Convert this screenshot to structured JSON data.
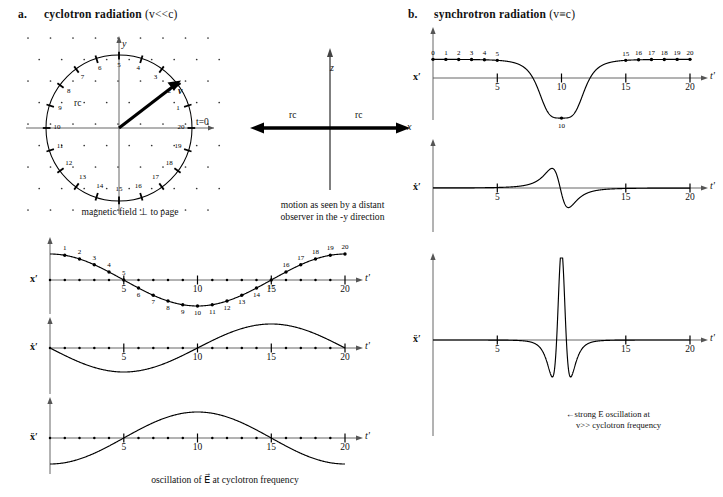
{
  "panels": {
    "a": {
      "letter": "a.",
      "title_bold": "cyclotron radiation",
      "title_paren": "(v<<c)",
      "circle_caption": "magnetic field ⊥ to page",
      "axis_y_label": "y",
      "radius_label": "rс",
      "velocity_label": "v",
      "t0_label": "t=0",
      "point_numbers": [
        "1",
        "2",
        "3",
        "4",
        "5",
        "6",
        "7",
        "8",
        "9",
        "10",
        "11",
        "12",
        "13",
        "14",
        "15",
        "16",
        "17",
        "18",
        "19",
        "20"
      ],
      "bottom_caption": "oscillation of E⃗ at cyclotron frequency"
    },
    "center": {
      "axis_z_label": "z",
      "axis_x_label": "x",
      "rc_left_label": "rс",
      "rc_right_label": "rс",
      "caption_line1": "motion as seen by a distant",
      "caption_line2": "observer in the -y direction"
    },
    "b": {
      "letter": "b.",
      "title_bold": "synchrotron radiation",
      "title_paren": "(v≡c)",
      "annotation_line1": "←strong E oscillation at",
      "annotation_line2": "v>> cyclotron frequency"
    }
  },
  "chart_data": [
    {
      "id": "a-plot-1",
      "type": "line",
      "title": "cyclotron x' vs t'",
      "ylabel": "x'",
      "xlabel": "t'",
      "xlim": [
        0,
        21
      ],
      "ylim": [
        -1.35,
        1.35
      ],
      "xticks": [
        5,
        10,
        15,
        20
      ],
      "xticklabels": [
        "5",
        "10",
        "15",
        "20"
      ],
      "grid": false,
      "marker_labels": [
        "1",
        "2",
        "3",
        "4",
        "5",
        "6",
        "7",
        "8",
        "9",
        "10",
        "11",
        "12",
        "13",
        "14",
        "15",
        "16",
        "17",
        "18",
        "19",
        "20"
      ],
      "x": [
        0,
        1,
        2,
        3,
        4,
        5,
        6,
        7,
        8,
        9,
        10,
        11,
        12,
        13,
        14,
        15,
        16,
        17,
        18,
        19,
        20
      ],
      "y": [
        1.0,
        0.951,
        0.809,
        0.588,
        0.309,
        0,
        -0.309,
        -0.588,
        -0.809,
        -0.951,
        -1.0,
        -0.951,
        -0.809,
        -0.588,
        -0.309,
        0,
        0.309,
        0.588,
        0.809,
        0.951,
        1.0
      ],
      "function": "cos(2*pi*t/20)"
    },
    {
      "id": "a-plot-2",
      "type": "line",
      "title": "cyclotron x-dot' vs t'",
      "ylabel": "ẋ'",
      "xlabel": "t'",
      "xlim": [
        0,
        21
      ],
      "ylim": [
        -1.35,
        1.35
      ],
      "xticks": [
        5,
        10,
        15,
        20
      ],
      "xticklabels": [
        "5",
        "10",
        "15",
        "20"
      ],
      "grid": false,
      "x": [
        0,
        1,
        2,
        3,
        4,
        5,
        6,
        7,
        8,
        9,
        10,
        11,
        12,
        13,
        14,
        15,
        16,
        17,
        18,
        19,
        20
      ],
      "y": [
        0,
        -0.309,
        -0.588,
        -0.809,
        -0.951,
        -1.0,
        -0.951,
        -0.809,
        -0.588,
        -0.309,
        0,
        0.309,
        0.588,
        0.809,
        0.951,
        1.0,
        0.951,
        0.809,
        0.588,
        0.309,
        0
      ],
      "function": "-sin(2*pi*t/20)"
    },
    {
      "id": "a-plot-3",
      "type": "line",
      "title": "cyclotron x-double-dot' vs t'",
      "ylabel": "ẍ'",
      "xlabel": "t'",
      "xlim": [
        0,
        21
      ],
      "ylim": [
        -1.35,
        1.35
      ],
      "xticks": [
        5,
        10,
        15,
        20
      ],
      "xticklabels": [
        "5",
        "10",
        "15",
        "20"
      ],
      "grid": false,
      "x": [
        0,
        1,
        2,
        3,
        4,
        5,
        6,
        7,
        8,
        9,
        10,
        11,
        12,
        13,
        14,
        15,
        16,
        17,
        18,
        19,
        20
      ],
      "y": [
        -1.0,
        -0.951,
        -0.809,
        -0.588,
        -0.309,
        0,
        0.309,
        0.588,
        0.809,
        0.951,
        1.0,
        0.951,
        0.809,
        0.588,
        0.309,
        0,
        -0.309,
        -0.588,
        -0.809,
        -0.951,
        -1.0
      ],
      "function": "-cos(2*pi*t/20)"
    },
    {
      "id": "b-plot-1",
      "type": "line",
      "title": "synchrotron x' vs t'",
      "ylabel": "x'",
      "xlabel": "t'",
      "xlim": [
        0,
        21
      ],
      "ylim": [
        -1.35,
        1.35
      ],
      "xticks": [
        5,
        10,
        15,
        20
      ],
      "xticklabels": [
        "5",
        "10",
        "15",
        "20"
      ],
      "grid": false,
      "marker_labels": [
        "0",
        "1",
        "2",
        "3",
        "4",
        "5",
        "10",
        "15",
        "16",
        "17",
        "18",
        "19",
        "20"
      ],
      "peak_label": "10",
      "note": "sharply dipping pulse; flat near +1 away from t'=10, deep narrow negative spike at t'=10"
    },
    {
      "id": "b-plot-2",
      "type": "line",
      "title": "synchrotron x-dot' vs t'",
      "ylabel": "ẋ'",
      "xlabel": "t'",
      "xlim": [
        0,
        21
      ],
      "ylim": [
        -1.35,
        1.35
      ],
      "xticks": [
        5,
        15,
        20
      ],
      "xticklabels": [
        "5",
        "15",
        "20"
      ],
      "grid": false,
      "note": "antisymmetric pulse: large negative swing just before t'=10 then large positive spike just after"
    },
    {
      "id": "b-plot-3",
      "type": "line",
      "title": "synchrotron x-double-dot' vs t'",
      "ylabel": "ẍ'",
      "xlabel": "t'",
      "xlim": [
        0,
        21
      ],
      "ylim": [
        -2.6,
        2.6
      ],
      "xticks": [
        5,
        15,
        20
      ],
      "xticklabels": [
        "5",
        "15",
        "20"
      ],
      "grid": false,
      "note": "extremely narrow very tall positive spike flanked by two deep negative spikes at t'=10"
    }
  ]
}
